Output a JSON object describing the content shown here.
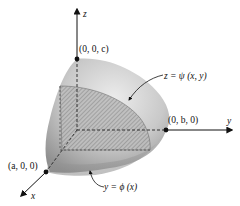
{
  "figure": {
    "axes": {
      "x": "x",
      "y": "y",
      "z": "z"
    },
    "points": {
      "z_intercept": "(0, 0, c)",
      "y_intercept": "(0, b, 0)",
      "x_intercept": "(a, 0, 0)"
    },
    "curve_labels": {
      "surface": "z = ψ (x, y)",
      "boundary": "y = ϕ (x)"
    },
    "colors": {
      "surface_light": "#e6e6e6",
      "surface_dark": "#9a9a9a",
      "hatch": "#555555",
      "ink": "#111111"
    }
  }
}
